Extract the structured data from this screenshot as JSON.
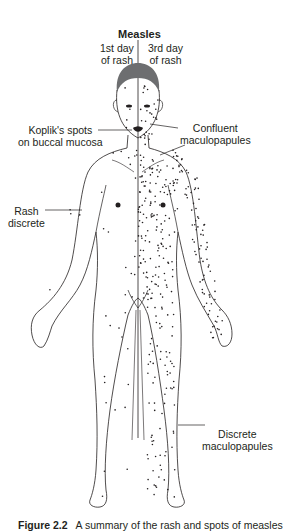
{
  "figure": {
    "title": "Measles",
    "columns": {
      "left": [
        "1st day",
        "of rash"
      ],
      "right": [
        "3rd day",
        "of rash"
      ]
    },
    "labels": {
      "kopliks": [
        "Koplik's spots",
        "on buccal mucosa"
      ],
      "confluent": [
        "Confluent",
        "maculopapules"
      ],
      "rash_discrete": [
        "Rash",
        "discrete"
      ],
      "discrete_maculopapules": [
        "Discrete",
        "maculopapules"
      ]
    },
    "caption": {
      "number": "Figure 2.2",
      "text": "A summary of the rash and spots of measles"
    },
    "colors": {
      "ink": "#231f20",
      "hair": "#6d6e70"
    }
  }
}
